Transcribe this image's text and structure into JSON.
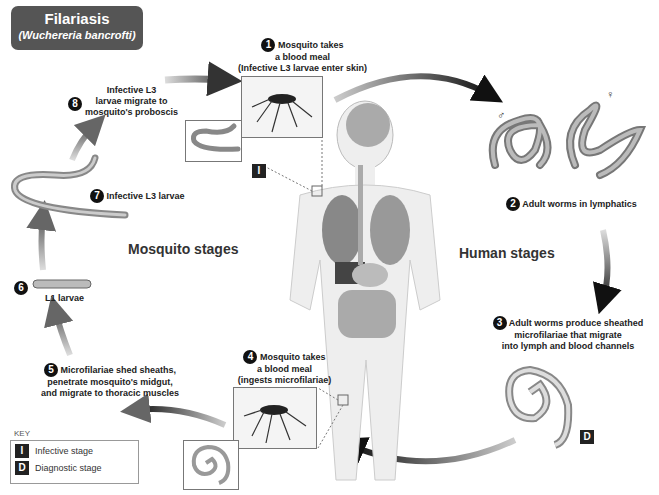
{
  "title": {
    "main": "Filariasis",
    "subtitle": "(Wuchereria bancrofti)"
  },
  "sections": {
    "mosquito": "Mosquito stages",
    "human": "Human stages"
  },
  "steps": [
    {
      "num": "1",
      "lines": [
        "Mosquito takes",
        "a blood meal",
        "(Infective L3 larvae enter skin)"
      ]
    },
    {
      "num": "2",
      "lines": [
        "Adult worms in lymphatics"
      ]
    },
    {
      "num": "3",
      "lines": [
        "Adult worms produce sheathed",
        "microfilariae that migrate",
        "into lymph and blood channels"
      ]
    },
    {
      "num": "4",
      "lines": [
        "Mosquito takes",
        "a blood meal",
        "(ingests microfilariae)"
      ]
    },
    {
      "num": "5",
      "lines": [
        "Microfilariae shed sheaths,",
        "penetrate mosquito's midgut,",
        "and migrate to thoracic muscles"
      ]
    },
    {
      "num": "6",
      "lines": [
        "L1 larvae"
      ]
    },
    {
      "num": "7",
      "lines": [
        "Infective L3 larvae"
      ]
    },
    {
      "num": "8",
      "lines": [
        "Infective L3",
        "larvae migrate to",
        "mosquito's proboscis"
      ]
    }
  ],
  "symbols": {
    "male": "♂",
    "female": "♀"
  },
  "badges": {
    "infective": "I",
    "diagnostic": "D"
  },
  "key": {
    "title": "KEY",
    "items": [
      {
        "badge": "I",
        "label": "Infective stage"
      },
      {
        "badge": "D",
        "label": "Diagnostic stage"
      }
    ]
  },
  "colors": {
    "title_bg": "#555555",
    "arrow": "#333333",
    "worm": "#9a9a9a",
    "badge_bg": "#222222"
  }
}
